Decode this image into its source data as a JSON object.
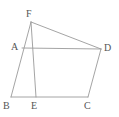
{
  "figure": {
    "background_color": "#ffffff",
    "line_color": "#9a9a9a",
    "label_color": "#555555",
    "canvas": {
      "width": 119,
      "height": 117
    },
    "vertices": [
      {
        "id": "F",
        "label": "F",
        "x": 31,
        "y": 22,
        "label_x": 26,
        "label_y": 9
      },
      {
        "id": "A",
        "label": "A",
        "x": 22,
        "y": 48,
        "label_x": 11,
        "label_y": 42
      },
      {
        "id": "D",
        "label": "D",
        "x": 101,
        "y": 49,
        "label_x": 104,
        "label_y": 43
      },
      {
        "id": "B",
        "label": "B",
        "x": 11,
        "y": 97,
        "label_x": 3,
        "label_y": 101
      },
      {
        "id": "E",
        "label": "E",
        "x": 36,
        "y": 97,
        "label_x": 31,
        "label_y": 101
      },
      {
        "id": "C",
        "label": "C",
        "x": 88,
        "y": 97,
        "label_x": 84,
        "label_y": 101
      }
    ],
    "edges": [
      {
        "id": "FD",
        "from": "F",
        "to": "D",
        "name": "segment-fd"
      },
      {
        "id": "FB",
        "from": "F",
        "to": "B",
        "name": "segment-fb"
      },
      {
        "id": "FE",
        "from": "F",
        "to": "E",
        "name": "segment-fe"
      },
      {
        "id": "AD",
        "from": "A",
        "to": "D",
        "name": "segment-ad"
      },
      {
        "id": "BC",
        "from": "B",
        "to": "C",
        "name": "segment-bc"
      },
      {
        "id": "DC",
        "from": "D",
        "to": "C",
        "name": "segment-dc"
      }
    ]
  }
}
